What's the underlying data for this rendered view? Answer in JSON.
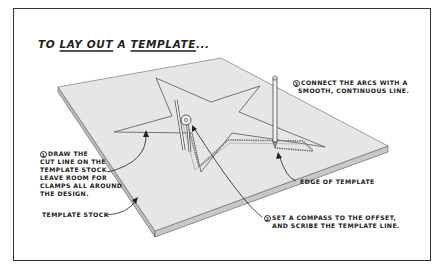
{
  "title": {
    "prefix": "TO ",
    "part1": "LAY OUT",
    "middle": " A ",
    "part2": "TEMPLATE",
    "suffix": "..."
  },
  "callouts": [
    {
      "number": "1",
      "lines": [
        "DRAW THE",
        "CUT LINE ON THE",
        "TEMPLATE STOCK.",
        "LEAVE ROOM FOR",
        "CLAMPS ALL AROUND",
        "THE DESIGN."
      ]
    },
    {
      "number": "2",
      "lines": [
        "SET A COMPASS TO THE OFFSET,",
        "AND SCRIBE THE TEMPLATE LINE."
      ]
    },
    {
      "number": "3",
      "lines": [
        "CONNECT THE ARCS WITH A",
        "SMOOTH, CONTINUOUS LINE."
      ]
    }
  ],
  "labels": {
    "edge_of_template": "EDGE OF TEMPLATE",
    "template_stock": "TEMPLATE STOCK"
  },
  "colors": {
    "board_fill": "#e4e4e4",
    "board_edge": "#b8b8b8",
    "ink": "#222222"
  }
}
